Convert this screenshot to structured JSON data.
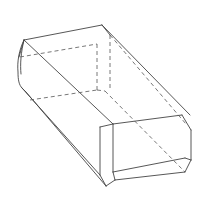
{
  "figure": {
    "title": "Rectangular prism with chamfered and rounded edges",
    "colors": {
      "background": "#ffffff",
      "visible_edge": "#444444",
      "hidden_edge": "#555555"
    },
    "visible_edges": [
      [
        24,
        40,
        102,
        25
      ],
      [
        102,
        25,
        190,
        115
      ],
      [
        102,
        25,
        110,
        35
      ],
      [
        24,
        40,
        113,
        124
      ],
      [
        24,
        40,
        19,
        57
      ],
      [
        100,
        127,
        113,
        124
      ],
      [
        113,
        124,
        182,
        115
      ],
      [
        182,
        115,
        191,
        130
      ],
      [
        191,
        130,
        191,
        160
      ],
      [
        191,
        160,
        185,
        172
      ],
      [
        185,
        172,
        115,
        180
      ],
      [
        115,
        180,
        106,
        186
      ],
      [
        100,
        127,
        100,
        175
      ],
      [
        100,
        175,
        106,
        186
      ],
      [
        113,
        124,
        113,
        172
      ],
      [
        113,
        172,
        115,
        180
      ],
      [
        113,
        172,
        185,
        158
      ],
      [
        185,
        158,
        191,
        160
      ],
      [
        22,
        88,
        100,
        175
      ],
      [
        26,
        92,
        106,
        186
      ],
      [
        22,
        88,
        26,
        92
      ]
    ],
    "visible_curves": [
      "M24,40 C19,50 17,62 18,72 C18,80 19,85 22,88",
      "M24,40 C21,52 20,64 21,74"
    ],
    "hidden_edges": [
      [
        20,
        57,
        97,
        44
      ],
      [
        97,
        44,
        97,
        90
      ],
      [
        110,
        35,
        110,
        90
      ],
      [
        30,
        100,
        97,
        90
      ],
      [
        110,
        35,
        186,
        124
      ],
      [
        97,
        90,
        105,
        91
      ],
      [
        105,
        91,
        185,
        172
      ]
    ]
  }
}
